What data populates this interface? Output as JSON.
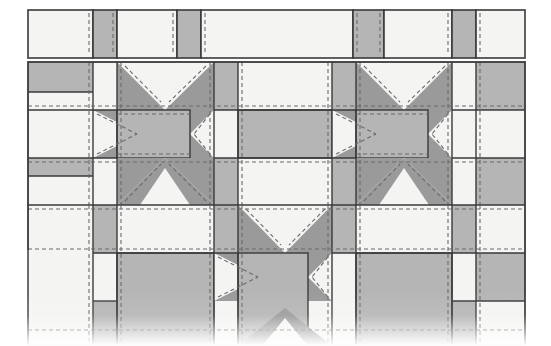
{
  "document": {
    "kind": "quilt-pattern-diagram",
    "title": "Sawtooth Star Sampler Quilt Layout",
    "description": "Pieced quilt top diagram showing sawtooth star blocks alternating with plain squares, separated by sashing strips and cornerstones, with dashed seam-stitch guide lines."
  },
  "canvas": {
    "width": 551,
    "height": 346,
    "background": "#ffffff"
  },
  "palette": {
    "background": "#ffffff",
    "light_fabric": "#f4f4f2",
    "medium_fabric": "#b5b5b5",
    "dark_fabric": "#9a9a9a",
    "outline": "#3a3a3a",
    "stitch_line": "#6a6a6a",
    "fade_overlay": "#ffffff"
  },
  "geometry": {
    "quilt_left": 28,
    "quilt_right": 525,
    "top_strip": {
      "y": 10,
      "height": 48
    },
    "gap_after_top_strip": 4,
    "row_block": {
      "y": 62,
      "height": 143
    },
    "row_bottom": {
      "y": 205,
      "height": 141
    },
    "outline_width": 1.6,
    "stitch_dash": "4 3",
    "stitch_width": 1.1,
    "stitch_inset": 4
  },
  "structure": {
    "columns_description": "Repeating sashing-plus-block rhythm across the quilt width",
    "column_edges": [
      28,
      93,
      117,
      214,
      238,
      332,
      356,
      452,
      476,
      525
    ],
    "sashing_width": 24,
    "block_width": 96,
    "row_edges_middle": [
      62,
      92,
      110,
      158,
      176,
      205
    ],
    "row_edges_bottom": [
      205,
      235,
      253,
      301,
      319,
      346
    ]
  },
  "top_strip": {
    "name": "top-sashing-strip",
    "cells": [
      {
        "label": "corner-square-light",
        "fill": "light_fabric",
        "x": 28,
        "width": 65
      },
      {
        "label": "cornerstone-medium",
        "fill": "medium_fabric",
        "x": 93,
        "width": 24
      },
      {
        "label": "sashing-light",
        "fill": "light_fabric",
        "x": 117,
        "width": 60
      },
      {
        "label": "cornerstone-medium",
        "fill": "medium_fabric",
        "x": 177,
        "width": 24
      },
      {
        "label": "sashing-long-light",
        "fill": "light_fabric",
        "x": 201,
        "width": 152
      },
      {
        "label": "cornerstone-medium",
        "fill": "medium_fabric",
        "x": 353,
        "width": 31
      },
      {
        "label": "sashing-light",
        "fill": "light_fabric",
        "x": 384,
        "width": 68
      },
      {
        "label": "cornerstone-medium",
        "fill": "medium_fabric",
        "x": 452,
        "width": 24
      },
      {
        "label": "sashing-light-end",
        "fill": "light_fabric",
        "x": 476,
        "width": 49
      }
    ]
  },
  "blocks": {
    "middle_row": [
      {
        "name": "sawtooth-star-block",
        "index": 0,
        "x": 117,
        "y": 92,
        "size": 96,
        "star_point_fill": "dark_fabric",
        "star_center_fill": "medium_fabric",
        "background_fill": "light_fabric"
      },
      {
        "name": "plain-square-block",
        "index": 1,
        "x": 238,
        "y": 92,
        "size": 96,
        "fill": "medium_fabric"
      },
      {
        "name": "sawtooth-star-block",
        "index": 2,
        "x": 356,
        "y": 92,
        "size": 96,
        "star_point_fill": "dark_fabric",
        "star_center_fill": "medium_fabric",
        "background_fill": "light_fabric"
      }
    ],
    "bottom_row": [
      {
        "name": "plain-square-block",
        "index": 0,
        "x": 117,
        "y": 235,
        "size": 96,
        "fill": "medium_fabric"
      },
      {
        "name": "sawtooth-star-block",
        "index": 1,
        "x": 238,
        "y": 235,
        "size": 96,
        "star_point_fill": "dark_fabric",
        "star_center_fill": "medium_fabric",
        "background_fill": "light_fabric"
      },
      {
        "name": "plain-square-block",
        "index": 2,
        "x": 356,
        "y": 235,
        "size": 96,
        "fill": "medium_fabric"
      }
    ]
  },
  "effects": {
    "bottom_fade": {
      "enabled": true,
      "start_y": 300,
      "end_y": 346,
      "note": "Image fades to white at the lower edge"
    }
  }
}
